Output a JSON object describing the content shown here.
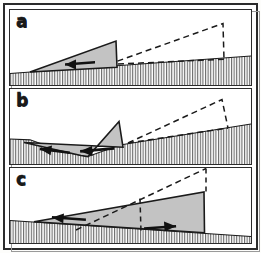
{
  "figure": {
    "panel_count": 3,
    "background_color": "#ffffff",
    "frame_color": "#2b2b2b",
    "wedge_fill_color": "#c3c3c3",
    "wedge_stroke_color": "#1a1a1a",
    "dashed_stroke_color": "#1a1a1a",
    "hatch_color": "#4a4a4a",
    "arrow_color": "#111111"
  },
  "panels": [
    {
      "id": "a",
      "label": "a",
      "description": "Initial state: thin tapering wedge resting on a gently right-rising hatched basement; a dashed reference wedge of identical form lies to the right.",
      "ground": {
        "type": "hatched-basement",
        "slope": "rises gently to the right",
        "hatch": "vertical lines"
      },
      "solid_wedge": {
        "fill": "#c3c3c3",
        "apex_side": "left",
        "back_wall_side": "right",
        "taper": "tapers to a point at the left"
      },
      "dashed_wedge": {
        "style": "dashed",
        "position": "right half of panel",
        "apex_side": "left",
        "back_wall_side": "right"
      },
      "arrows": [
        {
          "name": "transport-arrow-1",
          "direction": "left",
          "count": 1
        }
      ],
      "arrow_count": 1
    },
    {
      "id": "b",
      "label": "b",
      "description": "Intermediate state: wedge shortened and kinked, its base buckled downward into the basement; the dashed reference outline has rotated and steepened at the right.",
      "ground": {
        "type": "hatched-basement",
        "slope": "rises gently to the right with a downward notch beneath the wedge",
        "hatch": "vertical lines"
      },
      "solid_wedge": {
        "fill": "#c3c3c3",
        "apex_side": "left",
        "back_wall_side": "right",
        "taper": "kinked / folded body with a basal notch"
      },
      "dashed_wedge": {
        "style": "dashed",
        "position": "right half of panel",
        "apex_side": "left",
        "back_wall_side": "right"
      },
      "arrows": [
        {
          "name": "transport-arrow-1",
          "direction": "left",
          "count": 1
        },
        {
          "name": "transport-arrow-2",
          "direction": "left",
          "count": 1
        }
      ],
      "arrow_count": 2
    },
    {
      "id": "c",
      "label": "c",
      "description": "Final state: thickened wedge with a steep right back wall resting on a basement that now slopes down to the right; a dashed ramp cuts up through the wedge to a dashed apex above the back wall.",
      "ground": {
        "type": "hatched-basement",
        "slope": "slopes down to the right",
        "hatch": "vertical lines"
      },
      "solid_wedge": {
        "fill": "#c3c3c3",
        "apex_side": "left",
        "back_wall_side": "right",
        "taper": "thickened, tapering to a point at the left"
      },
      "dashed_wedge": {
        "style": "dashed",
        "position": "cuts diagonally through wedge to upper right",
        "apex_side": "left",
        "back_wall_side": "right"
      },
      "arrows": [
        {
          "name": "transport-arrow-1",
          "direction": "left",
          "count": 1
        },
        {
          "name": "transport-arrow-2",
          "direction": "right",
          "count": 1
        }
      ],
      "arrow_count": 2
    }
  ]
}
